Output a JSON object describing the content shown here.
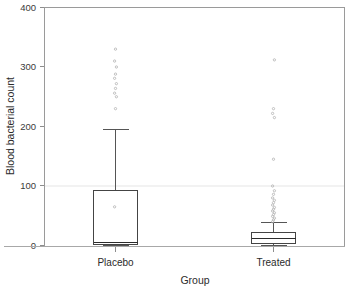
{
  "chart_data": {
    "type": "box",
    "title": "",
    "xlabel": "Group",
    "ylabel": "Blood bacterial count",
    "categories": [
      "Placebo",
      "Treated"
    ],
    "ylim": [
      0,
      400
    ],
    "yticks": [
      0,
      100,
      200,
      300,
      400
    ],
    "ytick_labels": [
      "0",
      "100",
      "200",
      "300",
      "400"
    ],
    "grid": false,
    "legend": "none",
    "boxes": [
      {
        "name": "Placebo",
        "q1": 1,
        "median": 5,
        "q3": 93,
        "whisker_low": 0,
        "whisker_high": 195,
        "outliers": [
          65,
          230,
          250,
          256,
          264,
          272,
          281,
          288,
          300,
          310,
          330
        ]
      },
      {
        "name": "Treated",
        "q1": 3,
        "median": 12,
        "q3": 22,
        "whisker_low": 0,
        "whisker_high": 38,
        "outliers": [
          40,
          43,
          46,
          49,
          52,
          55,
          58,
          61,
          64,
          68,
          72,
          76,
          80,
          86,
          92,
          100,
          145,
          215,
          222,
          230,
          312
        ]
      }
    ]
  },
  "axes": {
    "y_tick_0": "0",
    "y_tick_100": "100",
    "y_tick_200": "200",
    "y_tick_300": "300",
    "y_tick_400": "400",
    "y_axis_title": "Blood bacterial count",
    "x_axis_title": "Group",
    "cat_1": "Placebo",
    "cat_2": "Treated"
  },
  "colors": {
    "background": "#ffffff",
    "frame": "#9a9a9a",
    "box_stroke": "#444444",
    "box_fill": "#ffffff",
    "median": "#2b2b2b",
    "whisker": "#555555",
    "outlier": "#b9b9b9",
    "text": "#2b2b2b",
    "gridline": "#f2f2f2"
  }
}
